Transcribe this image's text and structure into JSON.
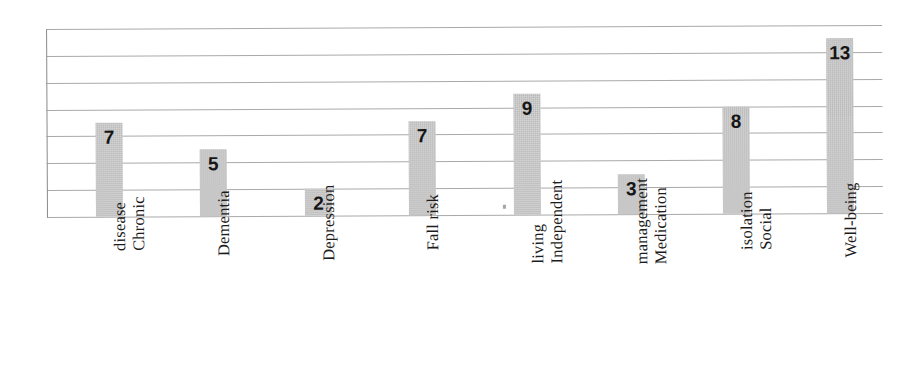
{
  "chart_data": {
    "type": "bar",
    "title": "",
    "subtitle": "",
    "xlabel": "",
    "ylabel": "",
    "categories": [
      "Chronic disease",
      "Dementia",
      "Depression",
      "Fall risk",
      "Independent living",
      "Medication management",
      "Social isolation",
      "Well-being"
    ],
    "category_lines": [
      [
        "Chronic",
        "disease"
      ],
      [
        "Dementia"
      ],
      [
        "Depression"
      ],
      [
        "Fall risk"
      ],
      [
        "Independent",
        "living"
      ],
      [
        "Medication",
        "management"
      ],
      [
        "Social",
        "isolation"
      ],
      [
        "Well-being"
      ]
    ],
    "values": [
      7,
      5,
      2,
      7,
      9,
      3,
      8,
      13
    ],
    "value_labels": [
      "7",
      "5",
      "2",
      "7",
      "9",
      "3",
      "8",
      "13"
    ],
    "ylim": [
      0,
      14
    ],
    "y_gridline_values": [
      14,
      12,
      10,
      8,
      6,
      4,
      2,
      0
    ],
    "grid": true,
    "grid_horizontal_only": true,
    "y_tick_labels_visible": false,
    "legend": false,
    "legend_position": "none",
    "bar_color": "#c9c9c9",
    "gridline_color": "#9a9a9a",
    "value_label_color": "#161616",
    "category_label_color": "#1c1c1c",
    "background_color": "#ffffff",
    "category_label_rotation": -90
  }
}
